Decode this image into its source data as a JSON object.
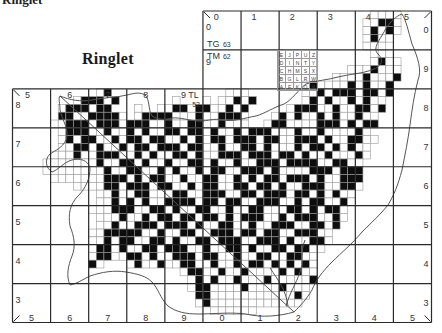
{
  "page": {
    "clipped_heading": "Ringlet",
    "species_title": "Ringlet"
  },
  "map": {
    "frame": {
      "left": 12.5,
      "top": 11,
      "right": 431.5,
      "bottom": 322.5
    },
    "cell_cols": 55,
    "cell_rows": 40,
    "major_every": 5,
    "colors": {
      "recorded": "#0d0d0d",
      "surveyed": "#ffffff",
      "cell_border": "#9a9a9a",
      "major_grid": "#2a2a2a",
      "coast": "#555555"
    },
    "top_easting_labels": [
      "0",
      "1",
      "2",
      "3",
      "4",
      "5"
    ],
    "lower_top_easting_labels": [
      "5",
      "6",
      "7",
      "8",
      "9 TL"
    ],
    "bottom_easting_labels": [
      "5",
      "6",
      "7",
      "8",
      "9",
      "0",
      "1",
      "2",
      "3",
      "4",
      "5"
    ],
    "left_northing_labels": [
      "8",
      "7",
      "6",
      "5",
      "4",
      "3"
    ],
    "right_northing_labels": [
      "0",
      "9",
      "8",
      "7",
      "6",
      "5",
      "4",
      "3"
    ],
    "upper_left_northing_labels": [
      "0",
      "9"
    ],
    "grid_square_labels": {
      "tg": "TG",
      "tg_num": "63",
      "tm": "TM",
      "tm_num": "62",
      "tl_num": "52"
    },
    "tetrad_key": [
      [
        "E",
        "J",
        "P",
        "U",
        "Z"
      ],
      [
        "D",
        "I",
        "N",
        "T",
        "Y"
      ],
      [
        "C",
        "H",
        "M",
        "S",
        "X"
      ],
      [
        "B",
        "G",
        "L",
        "R",
        "W"
      ],
      [
        "A",
        "F",
        "K",
        "Q",
        "V"
      ]
    ],
    "tetrads": [
      "...............................................oooo....",
      "..............................................oo##o....",
      "..............................................o#o#o....",
      "..............................................o#oo.....",
      "..............................................ooo......",
      "...............................................ooo.....",
      "...............................................o#oo....",
      "............................................ooo#ooo....",
      "..........................................oooo#ooo#....",
      "......................................o#oooo#o#oo#.....",
      "...........o#...............ooo.......oo#o###o##o#.....",
      "........o###o#.......o...o.oo#o#......o#o#oo#o#oo......",
      "......o###o##...o..oo##o##oo#o#.....o###oo#oo##o#......",
      "......##oo####o.o####ooo#oo###o...o#o#oo#o#oo#oo.......",
      ".....oo###o###o###oo#oo##oo#ooo..o##oooo###o#o##.......",
      "......o###oo#oo#o#oo##o##o#oo#o###ooo#oo#oooo#o.......",
      "......o#o##oo#o##o##oo#o#o##o###o##oo###o#oo##oo......",
      "......oo##o#oo#o##o###o##oo#oo##o#ooo#o##o#o#oo.......",
      ".....ooo#oo###oo#o#oo##o#oo###o###o##o#oo#ooo#o.......",
      "....ooooooo#oo##o#oo#oo##o#oo#oo###o####oo##oo........",
      "....oooooooo#oo##oo#o#oo#o##oo###o#oooo###o###........",
      ".....ooooooo###o#o##oo#oo##oo#o#o##o###o#oo###........",
      "........oooo##o###o##oo#o##oo##o##o#oo###oo##o........",
      "...........oo#oo##ooo##oo###oo##o###o##o#o#oo.........",
      "...........oo#o#o#oo####o##o##oo###oo#o##oo#o.........",
      "..........ooo###oo##o#oo##oo#oo##ooo##o#o##o..........",
      "...........ooo#oo#o##o##o##o#o###oo#o###oo#o..........",
      "...........oo#oo###o###o#oo##oo#oo###oo##o#...........",
      "..........oo#####oo#oo##oo###o##o##oo###oo............",
      "..........oo#o##oo##o#oo##o###oo###o#oo##o............",
      "..........o##o#oo##o###oo#oo##o#oo##o##oo.............",
      "..........o##oo##o#oo###o##oo#oo##oo##oo..............",
      "..........#o...o#oo#oo##oo#oo#o##o#o#o#o..............",
      "......................o##oo#oo#oooo#o#oo..............",
      ".......................o#o#oo#ooo#ooooo#..............",
      ".......................o##oooo#oooo#ooo...............",
      "........................##ooooooooooo#o...............",
      "........................o#oooooooooooo................",
      "..........................oooooo......................",
      "......................................................."
    ]
  }
}
